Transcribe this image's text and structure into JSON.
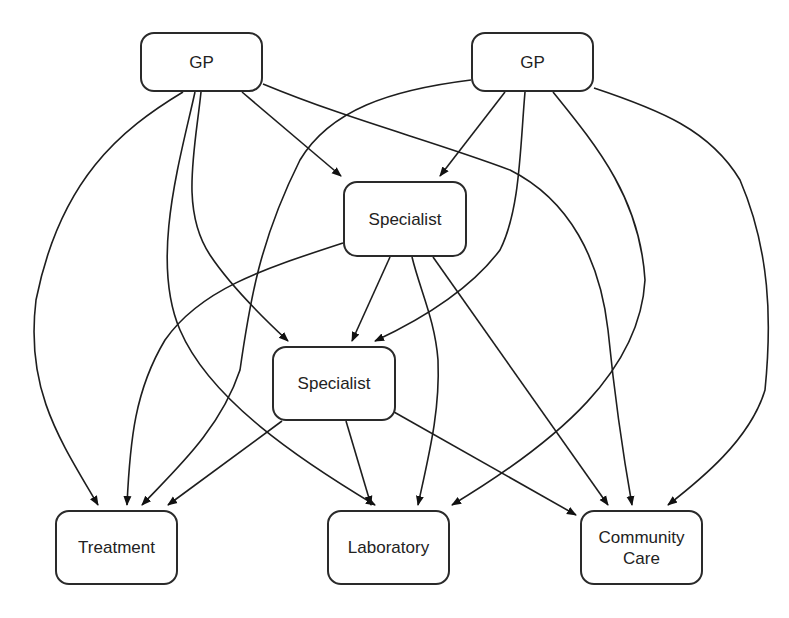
{
  "diagram": {
    "type": "flowchart",
    "nodes": [
      {
        "id": "gp1",
        "label": "GP",
        "x": 140,
        "y": 32,
        "w": 123,
        "h": 60
      },
      {
        "id": "gp2",
        "label": "GP",
        "x": 471,
        "y": 32,
        "w": 123,
        "h": 60
      },
      {
        "id": "spec1",
        "label": "Specialist",
        "x": 343,
        "y": 181,
        "w": 124,
        "h": 76
      },
      {
        "id": "spec2",
        "label": "Specialist",
        "x": 272,
        "y": 346,
        "w": 124,
        "h": 75
      },
      {
        "id": "treatment",
        "label": "Treatment",
        "x": 55,
        "y": 510,
        "w": 123,
        "h": 75
      },
      {
        "id": "laboratory",
        "label": "Laboratory",
        "x": 327,
        "y": 510,
        "w": 123,
        "h": 75
      },
      {
        "id": "community",
        "label": "Community\nCare",
        "x": 580,
        "y": 510,
        "w": 123,
        "h": 75
      }
    ],
    "edges": [
      {
        "from": "gp1",
        "to": "treatment",
        "d": "M 183 92 C 120 130, 60 180, 36 300 C 25 390, 60 440, 98 505"
      },
      {
        "from": "gp1",
        "to": "laboratory",
        "d": "M 195 92 C 180 160, 150 260, 180 330 C 210 400, 300 460, 375 505"
      },
      {
        "from": "gp1",
        "to": "spec2",
        "d": "M 201 92 C 195 150, 180 210, 210 255 C 230 285, 260 315, 288 341"
      },
      {
        "from": "gp1",
        "to": "spec1",
        "d": "M 242 92 L 341 176"
      },
      {
        "from": "gp1",
        "to": "community",
        "d": "M 263 84 C 350 120, 430 140, 510 170 C 570 200, 600 260, 608 330 C 615 400, 624 460, 632 505"
      },
      {
        "from": "gp2",
        "to": "treatment",
        "d": "M 471 80 C 390 90, 330 110, 300 160 C 260 240, 250 300, 240 370 C 220 430, 175 470, 142 505"
      },
      {
        "from": "gp2",
        "to": "spec1",
        "d": "M 505 92 L 440 176"
      },
      {
        "from": "gp2",
        "to": "spec2",
        "d": "M 525 92 C 520 150, 520 210, 500 250 C 470 290, 420 320, 375 341"
      },
      {
        "from": "gp2",
        "to": "laboratory",
        "d": "M 553 92 C 600 150, 640 200, 645 280 C 640 370, 560 440, 452 505"
      },
      {
        "from": "gp2",
        "to": "community",
        "d": "M 594 88 C 660 110, 710 130, 740 180 C 770 250, 772 320, 765 390 C 750 440, 700 480, 668 505"
      },
      {
        "from": "spec1",
        "to": "treatment",
        "d": "M 343 243 C 260 270, 200 290, 165 340 C 135 390, 130 440, 127 505"
      },
      {
        "from": "spec1",
        "to": "spec2",
        "d": "M 390 257 L 352 341"
      },
      {
        "from": "spec1",
        "to": "laboratory",
        "d": "M 412 257 C 420 290, 435 320, 438 360 C 440 410, 430 450, 418 505"
      },
      {
        "from": "spec1",
        "to": "community",
        "d": "M 433 257 L 608 505"
      },
      {
        "from": "spec2",
        "to": "treatment",
        "d": "M 282 421 L 168 505"
      },
      {
        "from": "spec2",
        "to": "laboratory",
        "d": "M 346 421 L 371 505"
      },
      {
        "from": "spec2",
        "to": "community",
        "d": "M 394 412 L 576 515"
      }
    ]
  }
}
